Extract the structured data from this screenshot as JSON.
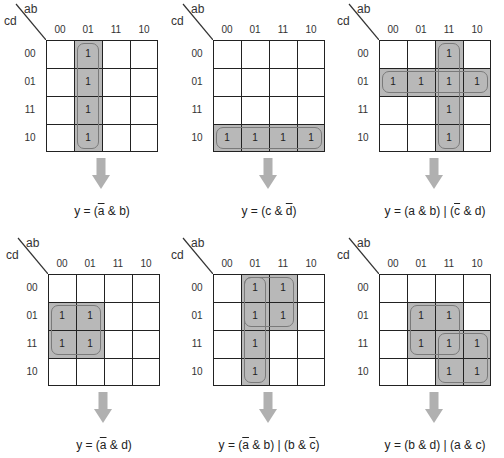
{
  "axis": {
    "top_var": "ab",
    "side_var": "cd",
    "col_labels": [
      "00",
      "01",
      "11",
      "10"
    ],
    "row_labels": [
      "00",
      "01",
      "11",
      "10"
    ]
  },
  "ones_label": "1",
  "maps": [
    {
      "id": "m1",
      "ones": [
        [
          0,
          1
        ],
        [
          1,
          1
        ],
        [
          2,
          1
        ],
        [
          3,
          1
        ]
      ],
      "shades": [
        {
          "r": 0,
          "c": 1,
          "rs": 4,
          "cs": 1
        }
      ],
      "loops": [
        {
          "r": 0,
          "c": 1,
          "rs": 4,
          "cs": 1
        }
      ],
      "equation": [
        "y = (",
        "a",
        "",
        "& b)"
      ],
      "eq_parts": [
        {
          "t": "y = ("
        },
        {
          "t": "a",
          "ov": true
        },
        {
          "t": " & b)"
        }
      ]
    },
    {
      "id": "m2",
      "ones": [
        [
          3,
          0
        ],
        [
          3,
          1
        ],
        [
          3,
          2
        ],
        [
          3,
          3
        ]
      ],
      "shades": [
        {
          "r": 3,
          "c": 0,
          "rs": 1,
          "cs": 4
        }
      ],
      "loops": [
        {
          "r": 3,
          "c": 0,
          "rs": 1,
          "cs": 4
        }
      ],
      "eq_parts": [
        {
          "t": "y = (c & "
        },
        {
          "t": "d",
          "ov": true
        },
        {
          "t": ")"
        }
      ]
    },
    {
      "id": "m3",
      "ones": [
        [
          0,
          2
        ],
        [
          1,
          0
        ],
        [
          1,
          1
        ],
        [
          1,
          2
        ],
        [
          1,
          3
        ],
        [
          2,
          2
        ],
        [
          3,
          2
        ]
      ],
      "shades": [
        {
          "r": 0,
          "c": 2,
          "rs": 4,
          "cs": 1
        },
        {
          "r": 1,
          "c": 0,
          "rs": 1,
          "cs": 4
        }
      ],
      "loops": [
        {
          "r": 0,
          "c": 2,
          "rs": 4,
          "cs": 1
        },
        {
          "r": 1,
          "c": 0,
          "rs": 1,
          "cs": 4
        }
      ],
      "eq_parts": [
        {
          "t": "y = (a & b) | ("
        },
        {
          "t": "c",
          "ov": true
        },
        {
          "t": " & d)"
        }
      ]
    },
    {
      "id": "m4",
      "ones": [
        [
          1,
          0
        ],
        [
          1,
          1
        ],
        [
          2,
          0
        ],
        [
          2,
          1
        ]
      ],
      "shades": [
        {
          "r": 1,
          "c": 0,
          "rs": 2,
          "cs": 2
        }
      ],
      "loops": [
        {
          "r": 1,
          "c": 0,
          "rs": 2,
          "cs": 2
        }
      ],
      "eq_parts": [
        {
          "t": "y = ("
        },
        {
          "t": "a",
          "ov": true
        },
        {
          "t": " & d)"
        }
      ]
    },
    {
      "id": "m5",
      "ones": [
        [
          0,
          1
        ],
        [
          0,
          2
        ],
        [
          1,
          1
        ],
        [
          1,
          2
        ],
        [
          2,
          1
        ],
        [
          3,
          1
        ]
      ],
      "shades": [
        {
          "r": 0,
          "c": 1,
          "rs": 4,
          "cs": 1
        },
        {
          "r": 0,
          "c": 2,
          "rs": 2,
          "cs": 1
        }
      ],
      "loops": [
        {
          "r": 0,
          "c": 1,
          "rs": 4,
          "cs": 1
        },
        {
          "r": 0,
          "c": 1,
          "rs": 2,
          "cs": 2
        }
      ],
      "eq_parts": [
        {
          "t": "y = ("
        },
        {
          "t": "a",
          "ov": true
        },
        {
          "t": " & b) | (b & "
        },
        {
          "t": "c",
          "ov": true
        },
        {
          "t": ")"
        }
      ]
    },
    {
      "id": "m6",
      "ones": [
        [
          1,
          1
        ],
        [
          1,
          2
        ],
        [
          2,
          1
        ],
        [
          2,
          2
        ],
        [
          2,
          3
        ],
        [
          3,
          2
        ],
        [
          3,
          3
        ]
      ],
      "shades": [
        {
          "r": 1,
          "c": 1,
          "rs": 2,
          "cs": 2
        },
        {
          "r": 2,
          "c": 2,
          "rs": 2,
          "cs": 2
        }
      ],
      "loops": [
        {
          "r": 1,
          "c": 1,
          "rs": 2,
          "cs": 2
        },
        {
          "r": 2,
          "c": 2,
          "rs": 2,
          "cs": 2
        }
      ],
      "eq_parts": [
        {
          "t": "y = (b & d) | (a & c)"
        }
      ]
    }
  ],
  "positions": [
    [
      0,
      0
    ],
    [
      167,
      0
    ],
    [
      333,
      0
    ],
    [
      2,
      234
    ],
    [
      167,
      234
    ],
    [
      333,
      234
    ]
  ],
  "colors": {
    "shade": "#b8b8b8",
    "loop": "#7a7a7a",
    "arrow": "#b0b0b0",
    "grid": "#222222"
  }
}
